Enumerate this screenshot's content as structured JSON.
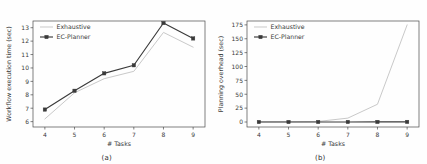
{
  "figure": {
    "background_color": "#fefefe",
    "panels": [
      {
        "caption": "(a)",
        "chart_data": {
          "type": "line",
          "title": "",
          "subtitle": "",
          "xlabel": "# Tasks",
          "ylabel": "Workflow execution time (sec)",
          "x": [
            4,
            5,
            6,
            7,
            8,
            9
          ],
          "xticklabels": [
            "4",
            "5",
            "6",
            "7",
            "8",
            "9"
          ],
          "yticklabels": [
            "6",
            "7",
            "8",
            "9",
            "10",
            "11",
            "12",
            "13"
          ],
          "xlim": [
            3.6,
            9.4
          ],
          "ylim": [
            5.6,
            13.5
          ],
          "yticks": [
            6,
            7,
            8,
            9,
            10,
            11,
            12,
            13
          ],
          "grid": false,
          "legend_position": "upper left",
          "series": [
            {
              "name": "Exhaustive",
              "values": [
                6.2,
                8.15,
                9.2,
                9.75,
                12.65,
                11.55
              ],
              "color": "#c9c9c9",
              "marker": "none"
            },
            {
              "name": "EC-Planner",
              "values": [
                6.9,
                8.3,
                9.6,
                10.2,
                13.35,
                12.2
              ],
              "color": "#3a3a3a",
              "marker": "square"
            }
          ]
        }
      },
      {
        "caption": "(b)",
        "chart_data": {
          "type": "line",
          "title": "",
          "subtitle": "",
          "xlabel": "# Tasks",
          "ylabel": "Planning overhead (sec)",
          "x": [
            4,
            5,
            6,
            7,
            8,
            9
          ],
          "xticklabels": [
            "4",
            "5",
            "6",
            "7",
            "8",
            "9"
          ],
          "yticklabels": [
            "0",
            "25",
            "50",
            "75",
            "100",
            "125",
            "150",
            "175"
          ],
          "xlim": [
            3.6,
            9.4
          ],
          "ylim": [
            -9,
            182
          ],
          "yticks": [
            0,
            25,
            50,
            75,
            100,
            125,
            150,
            175
          ],
          "grid": false,
          "legend_position": "upper left",
          "series": [
            {
              "name": "Exhaustive",
              "values": [
                0.3,
                0.5,
                1.0,
                7.0,
                32.0,
                175.0
              ],
              "color": "#c9c9c9",
              "marker": "none"
            },
            {
              "name": "EC-Planner",
              "values": [
                0.05,
                0.05,
                0.08,
                0.1,
                0.15,
                0.2
              ],
              "color": "#3a3a3a",
              "marker": "square"
            }
          ]
        }
      }
    ]
  }
}
